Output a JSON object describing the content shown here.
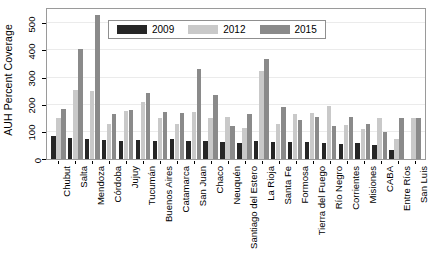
{
  "chart_data": {
    "type": "bar",
    "title": "",
    "xlabel": "",
    "ylabel": "AUH Percent Coverage",
    "ylim": [
      0,
      560
    ],
    "yticks": [
      0,
      100,
      200,
      300,
      400,
      500
    ],
    "grid": true,
    "legend_position": "top-center-inside",
    "categories": [
      "Chubut",
      "Salta",
      "Mendoza",
      "Córdoba",
      "Jujuy",
      "Tucumán",
      "Buenos Aires",
      "Catamarca",
      "San Juan",
      "Chaco",
      "Neuquén",
      "Santiago del Estero",
      "La Rioja",
      "Santa Fe",
      "Formosa",
      "Tierra del Fuego",
      "Río Negro",
      "Corrientes",
      "Misiones",
      "CABA",
      "Entre Ríos",
      "San Luis"
    ],
    "series": [
      {
        "name": "2009",
        "color": "#262626",
        "values": [
          83,
          78,
          72,
          70,
          68,
          70,
          68,
          72,
          66,
          68,
          62,
          60,
          66,
          62,
          64,
          62,
          60,
          56,
          58,
          52,
          35,
          0
        ]
      },
      {
        "name": "2012",
        "color": "#c9c9c9",
        "values": [
          152,
          253,
          250,
          130,
          178,
          210,
          150,
          128,
          175,
          150,
          155,
          115,
          325,
          128,
          165,
          170,
          195,
          125,
          110,
          150,
          75,
          150
        ]
      },
      {
        "name": "2015",
        "color": "#8a8a8a",
        "values": [
          183,
          405,
          530,
          165,
          180,
          245,
          172,
          170,
          330,
          235,
          120,
          165,
          370,
          190,
          143,
          155,
          120,
          155,
          130,
          98,
          150,
          152
        ]
      }
    ]
  },
  "legend": {
    "items": [
      {
        "label": "2009",
        "key": "y2009"
      },
      {
        "label": "2012",
        "key": "y2012"
      },
      {
        "label": "2015",
        "key": "y2015"
      }
    ]
  }
}
